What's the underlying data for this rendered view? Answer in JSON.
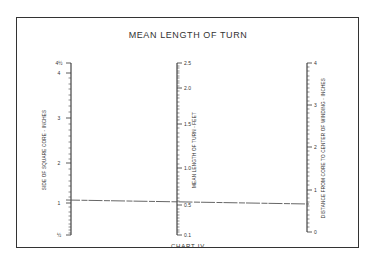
{
  "chart_data": {
    "type": "nomogram",
    "title": "MEAN LENGTH OF TURN",
    "footer": "CHART IV",
    "axes": [
      {
        "name": "left",
        "label": "SIDE OF SQUARE CORE - INCHES",
        "x": 71,
        "y_top": 63,
        "y_bottom": 235,
        "ticks": [
          {
            "label": "4½",
            "y": 63
          },
          {
            "label": "4",
            "y": 73
          },
          {
            "label": "3",
            "y": 118
          },
          {
            "label": "2",
            "y": 163
          },
          {
            "label": "1",
            "y": 203
          },
          {
            "label": "½",
            "y": 235
          }
        ],
        "minor_ticks": [
          78,
          84,
          89,
          95,
          100,
          106,
          112,
          124,
          130,
          136,
          142,
          148,
          154,
          159,
          169,
          175,
          181,
          186,
          192,
          197,
          207,
          212,
          216,
          220,
          224,
          227,
          230,
          233
        ]
      },
      {
        "name": "center",
        "label": "MEAN LENGTH OF TURN - FEET",
        "x": 177,
        "y_top": 63,
        "y_bottom": 235,
        "ticks": [
          {
            "label": "2.5",
            "y": 63
          },
          {
            "label": "2.0",
            "y": 88
          },
          {
            "label": "1.5",
            "y": 124
          },
          {
            "label": "1.0",
            "y": 168
          },
          {
            "label": "0.5",
            "y": 205
          },
          {
            "label": "0.1",
            "y": 235
          }
        ],
        "minor_ticks": [
          66,
          68,
          71,
          73,
          76,
          78,
          81,
          83,
          86,
          91,
          95,
          98,
          102,
          106,
          109,
          113,
          117,
          120,
          128,
          133,
          137,
          142,
          146,
          150,
          155,
          159,
          164,
          172,
          176,
          179,
          183,
          187,
          190,
          194,
          198,
          201,
          209,
          212,
          215,
          218,
          221,
          224,
          227,
          230,
          232
        ]
      },
      {
        "name": "right",
        "label": "DISTANCE FROM CORE TO CENTER OF WINDING - INCHES",
        "x": 307,
        "y_top": 63,
        "y_bottom": 232,
        "ticks": [
          {
            "label": "4",
            "y": 63
          },
          {
            "label": "3",
            "y": 105
          },
          {
            "label": "2",
            "y": 147
          },
          {
            "label": "1",
            "y": 190
          },
          {
            "label": "0",
            "y": 232
          }
        ],
        "minor_ticks": [
          67,
          71,
          76,
          80,
          84,
          88,
          92,
          97,
          101,
          109,
          113,
          118,
          122,
          126,
          130,
          134,
          139,
          143,
          151,
          155,
          160,
          164,
          168,
          172,
          176,
          181,
          185,
          194,
          198,
          202,
          206,
          210,
          215,
          219,
          223,
          227
        ]
      }
    ],
    "index_line": {
      "from": {
        "x": 66,
        "y": 200
      },
      "to": {
        "x": 309,
        "y": 204
      },
      "readings": {
        "left": "1",
        "center": "0.5",
        "right": "~0.7"
      }
    },
    "grid": false,
    "legend": null
  }
}
